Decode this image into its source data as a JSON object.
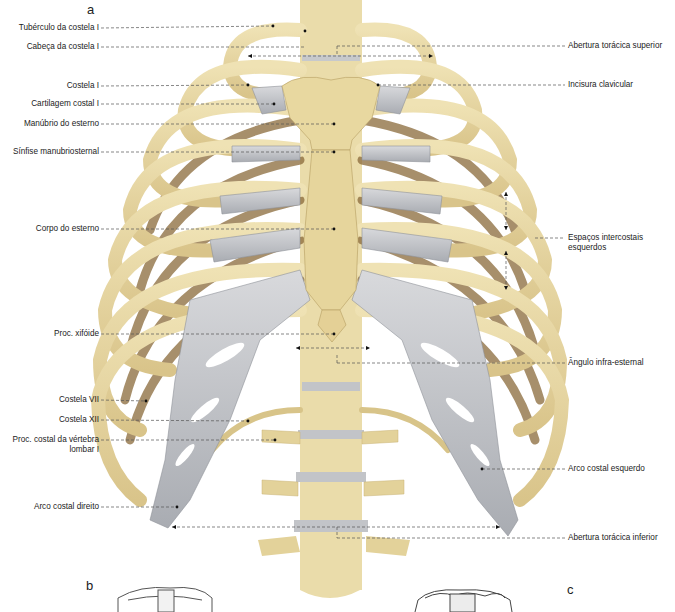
{
  "figure": {
    "panels": {
      "a": "a",
      "b": "b",
      "c": "c"
    },
    "colors": {
      "bone": "#e6d7a3",
      "bone_shade": "#b99e5c",
      "bone_dark": "#7a5a30",
      "cartilage": "#c9cbcf",
      "cartilage_shade": "#9c9fa5",
      "leader_line": "#555555",
      "background": "#ffffff"
    },
    "labels_left": [
      {
        "id": "tuberculo-costela-1",
        "text": "Tubérculo da costela I",
        "y": 28
      },
      {
        "id": "cabeca-costela-1",
        "text": "Cabeça da costela I",
        "y": 47
      },
      {
        "id": "costela-1",
        "text": "Costela I",
        "y": 86
      },
      {
        "id": "cartilagem-costal-1",
        "text": "Cartilagem costal I",
        "y": 104
      },
      {
        "id": "manubrio-esterno",
        "text": "Manúbrio do esterno",
        "y": 124
      },
      {
        "id": "sinfise-manubriosternal",
        "text": "Sínfise manubriosternal",
        "y": 152
      },
      {
        "id": "corpo-esterno",
        "text": "Corpo do esterno",
        "y": 229
      },
      {
        "id": "proc-xifoide",
        "text": "Proc. xifóide",
        "y": 334
      },
      {
        "id": "costela-7",
        "text": "Costela VII",
        "y": 400
      },
      {
        "id": "costela-12",
        "text": "Costela XII",
        "y": 420
      },
      {
        "id": "proc-costal-vertebra-lombar-1",
        "text": "Proc. costal da vértebra",
        "text2": "lombar I",
        "y": 440
      },
      {
        "id": "arco-costal-direito",
        "text": "Arco costal direito",
        "y": 507
      }
    ],
    "labels_right": [
      {
        "id": "abertura-toracica-superior",
        "text": "Abertura torácica superior",
        "y": 46
      },
      {
        "id": "incisura-clavicular",
        "text": "Incisura clavicular",
        "y": 85
      },
      {
        "id": "espacos-intercostais-esquerdos",
        "text": "Espaços intercostais",
        "text2": "esquerdos",
        "y": 238
      },
      {
        "id": "angulo-infra-esternal",
        "text": "Ângulo infra-esternal",
        "y": 363
      },
      {
        "id": "arco-costal-esquerdo",
        "text": "Arco costal esquerdo",
        "y": 469
      },
      {
        "id": "abertura-toracica-inferior",
        "text": "Abertura torácica inferior",
        "y": 538
      }
    ]
  }
}
